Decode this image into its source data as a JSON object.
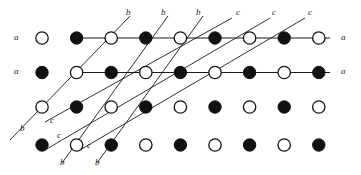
{
  "figure": {
    "name": "periodic-lattice-diagram",
    "colors": {
      "background": "#ffffff",
      "line": "#1a1a1a",
      "node_fill_filled": "#111111",
      "node_fill_open": "#ffffff",
      "node_stroke": "#111111",
      "label": "#1a1a1a"
    },
    "geometry": {
      "width": 361,
      "height": 175,
      "col_start_x": 42,
      "col_spacing": 34.6,
      "columns": 9,
      "row_y": [
        38,
        72.5,
        107,
        145
      ],
      "node_radius": 6.2
    },
    "rows": [
      {
        "index": 0,
        "y": 38,
        "has_horizontal_line": true,
        "line_label_left": "a",
        "line_label_right": "a",
        "nodes": [
          "open",
          "filled",
          "open",
          "filled",
          "open",
          "filled",
          "open",
          "filled",
          "open"
        ]
      },
      {
        "index": 1,
        "y": 72.5,
        "has_horizontal_line": true,
        "line_label_left": "a",
        "line_label_right": "a",
        "nodes": [
          "filled",
          "open",
          "filled",
          "open",
          "filled",
          "open",
          "filled",
          "open",
          "filled"
        ]
      },
      {
        "index": 2,
        "y": 107,
        "has_horizontal_line": false,
        "line_label_left": "",
        "line_label_right": "",
        "nodes": [
          "open",
          "filled",
          "open",
          "filled",
          "open",
          "filled",
          "open",
          "filled",
          "open"
        ]
      },
      {
        "index": 3,
        "y": 145,
        "has_horizontal_line": false,
        "line_label_left": "",
        "line_label_right": "",
        "nodes": [
          "filled",
          "open",
          "filled",
          "open",
          "filled",
          "open",
          "filled",
          "open",
          "filled"
        ]
      }
    ],
    "horizontal_lines": [
      {
        "label": "a",
        "y": 38,
        "x1": 72,
        "x2": 330,
        "label_left_x": 16,
        "label_right_x": 343
      },
      {
        "label": "a",
        "y": 72.5,
        "x1": 72,
        "x2": 330,
        "label_left_x": 16,
        "label_right_x": 343
      }
    ],
    "b_lines": [
      {
        "label": "b",
        "x1": 10,
        "y1": 140,
        "x2": 130,
        "y2": 16
      },
      {
        "label": "b",
        "x1": 62,
        "y1": 163,
        "x2": 168,
        "y2": 16
      },
      {
        "label": "b",
        "x1": 97,
        "y1": 163,
        "x2": 203,
        "y2": 16
      }
    ],
    "c_lines": [
      {
        "label": "c",
        "x1": 45,
        "y1": 122,
        "x2": 232,
        "y2": 18
      },
      {
        "label": "c",
        "x1": 45,
        "y1": 150,
        "x2": 270,
        "y2": 18
      },
      {
        "label": "c",
        "x1": 80,
        "y1": 150,
        "x2": 305,
        "y2": 18
      }
    ],
    "labels": [
      {
        "id": "a-left-row0",
        "text": "a",
        "x": 14,
        "y": 33
      },
      {
        "id": "a-right-row0",
        "text": "a",
        "x": 341,
        "y": 33
      },
      {
        "id": "a-left-row1",
        "text": "a",
        "x": 14,
        "y": 67
      },
      {
        "id": "a-right-row1",
        "text": "a",
        "x": 341,
        "y": 67
      },
      {
        "id": "b-top-1",
        "text": "b",
        "x": 126,
        "y": 8
      },
      {
        "id": "b-top-2",
        "text": "b",
        "x": 161,
        "y": 8
      },
      {
        "id": "b-top-3",
        "text": "b",
        "x": 196,
        "y": 8
      },
      {
        "id": "c-top-1",
        "text": "c",
        "x": 236,
        "y": 8
      },
      {
        "id": "c-top-2",
        "text": "c",
        "x": 272,
        "y": 8
      },
      {
        "id": "c-top-3",
        "text": "c",
        "x": 308,
        "y": 8
      },
      {
        "id": "b-left-1",
        "text": "b",
        "x": 20,
        "y": 124
      },
      {
        "id": "c-left-1",
        "text": "c",
        "x": 50,
        "y": 116
      },
      {
        "id": "c-left-2",
        "text": "c",
        "x": 57,
        "y": 131
      },
      {
        "id": "b-bottom-1",
        "text": "b",
        "x": 60,
        "y": 158
      },
      {
        "id": "c-bottom-1",
        "text": "c",
        "x": 87,
        "y": 141
      },
      {
        "id": "b-bottom-2",
        "text": "b",
        "x": 95,
        "y": 158
      }
    ]
  }
}
